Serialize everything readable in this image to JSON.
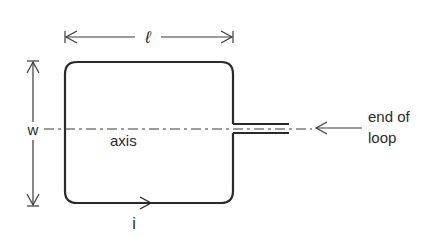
{
  "diagram": {
    "type": "rectangular current loop",
    "labels": {
      "length": "ℓ",
      "width": "w",
      "axis": "axis",
      "current": "i",
      "end_line1": "end of",
      "end_line2": "loop"
    },
    "colors": {
      "stroke": "#2a2a2a",
      "background": "#ffffff"
    }
  }
}
